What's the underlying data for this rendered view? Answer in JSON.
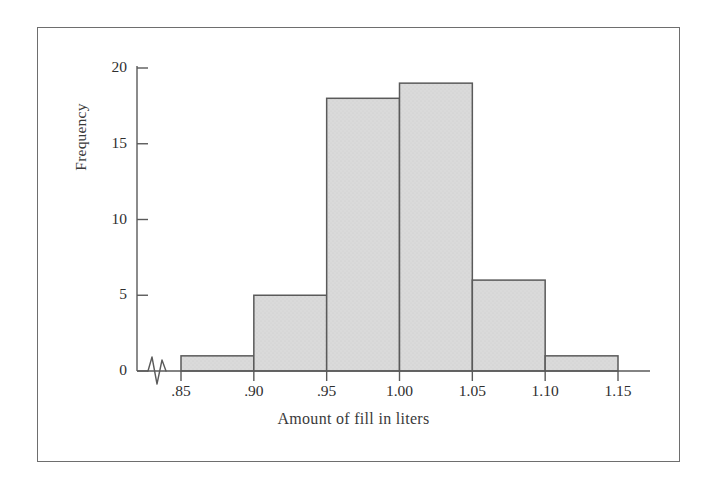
{
  "figure": {
    "border_color": "#6e6e6e",
    "background": "#ffffff"
  },
  "chart_data": {
    "type": "bar",
    "title": "",
    "subtitle": "",
    "xlabel": "Amount of fill in liters",
    "ylabel": "Frequency",
    "categories": [
      ".85-.90",
      ".90-.95",
      ".95-1.00",
      "1.00-1.05",
      "1.05-1.10",
      "1.10-1.15"
    ],
    "bin_edges": [
      0.85,
      0.9,
      0.95,
      1.0,
      1.05,
      1.1,
      1.15
    ],
    "values": [
      1,
      5,
      18,
      19,
      6,
      1
    ],
    "xtick_labels": [
      ".85",
      ".90",
      ".95",
      "1.00",
      "1.05",
      "1.10",
      "1.15"
    ],
    "xtick_values": [
      0.85,
      0.9,
      0.95,
      1.0,
      1.05,
      1.1,
      1.15
    ],
    "ytick_labels": [
      "0",
      "5",
      "10",
      "15",
      "20"
    ],
    "ytick_values": [
      0,
      5,
      10,
      15,
      20
    ],
    "ylim": [
      0,
      20
    ],
    "xlim": [
      0.85,
      1.15
    ],
    "grid": false,
    "legend": false,
    "axis_break": "x-axis zigzag break between origin and first bin",
    "bar_fill": "#d9d9d9",
    "bar_edge": "#5a5a5a",
    "axis_color": "#555555"
  },
  "ticks": {
    "y": [
      {
        "label": "20",
        "value": 20
      },
      {
        "label": "15",
        "value": 15
      },
      {
        "label": "10",
        "value": 10
      },
      {
        "label": "5",
        "value": 5
      },
      {
        "label": "0",
        "value": 0
      }
    ],
    "x": [
      {
        "label": ".85",
        "value": 0.85
      },
      {
        "label": ".90",
        "value": 0.9
      },
      {
        "label": ".95",
        "value": 0.95
      },
      {
        "label": "1.00",
        "value": 1.0
      },
      {
        "label": "1.05",
        "value": 1.05
      },
      {
        "label": "1.10",
        "value": 1.1
      },
      {
        "label": "1.15",
        "value": 1.15
      }
    ]
  }
}
